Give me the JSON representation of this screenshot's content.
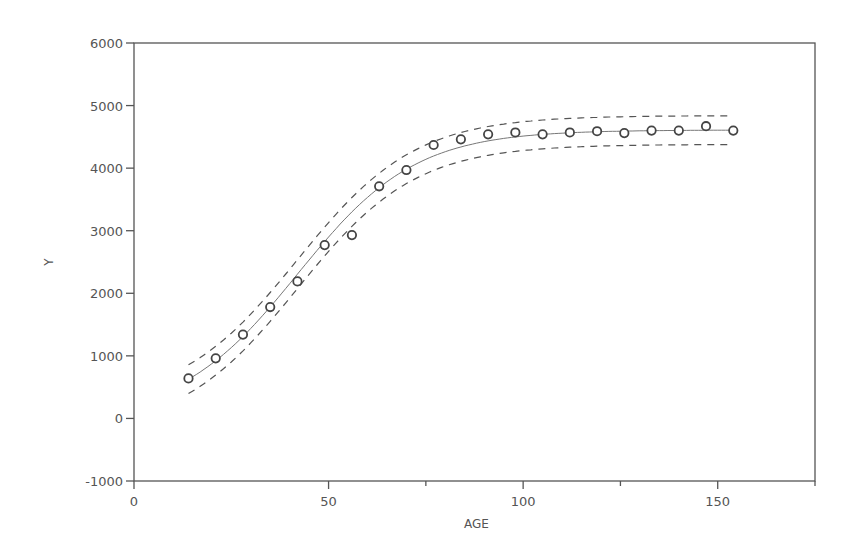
{
  "chart_data": {
    "type": "scatter",
    "title": "",
    "xlabel": "AGE",
    "ylabel": "Y",
    "xlim": [
      0,
      175
    ],
    "ylim": [
      -1000,
      6000
    ],
    "grid": false,
    "legend": null,
    "x_ticks": [
      {
        "value": 0,
        "label": "0"
      },
      {
        "value": 50,
        "label": "50"
      },
      {
        "value": 100,
        "label": "100"
      },
      {
        "value": 150,
        "label": "150"
      }
    ],
    "x_minor_ticks": [
      75,
      125,
      175
    ],
    "y_ticks": [
      {
        "value": -1000,
        "label": "-1000"
      },
      {
        "value": 0,
        "label": "0"
      },
      {
        "value": 1000,
        "label": "1000"
      },
      {
        "value": 2000,
        "label": "2000"
      },
      {
        "value": 3000,
        "label": "3000"
      },
      {
        "value": 4000,
        "label": "4000"
      },
      {
        "value": 5000,
        "label": "5000"
      },
      {
        "value": 6000,
        "label": "6000"
      }
    ],
    "series": [
      {
        "name": "Observed",
        "style": "open-circle-markers",
        "x": [
          14,
          21,
          28,
          35,
          42,
          49,
          56,
          63,
          70,
          77,
          84,
          91,
          98,
          105,
          112,
          119,
          126,
          133,
          140,
          147,
          154
        ],
        "y": [
          640,
          960,
          1340,
          1780,
          2190,
          2770,
          2930,
          3710,
          3970,
          4370,
          4460,
          4540,
          4570,
          4540,
          4570,
          4590,
          4560,
          4600,
          4600,
          4670,
          4600
        ]
      },
      {
        "name": "Fitted logistic curve",
        "style": "solid-line",
        "model": {
          "asymptote": 4610,
          "midpoint": 42,
          "rate": 0.066
        },
        "x": [
          14,
          28,
          42,
          56,
          70,
          84,
          98,
          112,
          126,
          140,
          154
        ],
        "y": [
          630,
          1320,
          2305,
          3290,
          3970,
          4330,
          4495,
          4565,
          4595,
          4605,
          4610
        ]
      },
      {
        "name": "Upper confidence band",
        "style": "dashed-line",
        "offset": 230,
        "x": [
          14,
          28,
          42,
          56,
          70,
          84,
          98,
          112,
          126,
          140,
          154
        ],
        "y": [
          860,
          1550,
          2535,
          3520,
          4200,
          4560,
          4725,
          4795,
          4825,
          4835,
          4840
        ]
      },
      {
        "name": "Lower confidence band",
        "style": "dashed-line",
        "offset": -230,
        "x": [
          14,
          28,
          42,
          56,
          70,
          84,
          98,
          112,
          126,
          140,
          154
        ],
        "y": [
          400,
          1090,
          2075,
          3060,
          3740,
          4100,
          4265,
          4335,
          4365,
          4375,
          4380
        ]
      }
    ],
    "colors": {
      "axis": "#555555",
      "line": "#777777",
      "marker": "#444444",
      "background": "#ffffff"
    }
  }
}
